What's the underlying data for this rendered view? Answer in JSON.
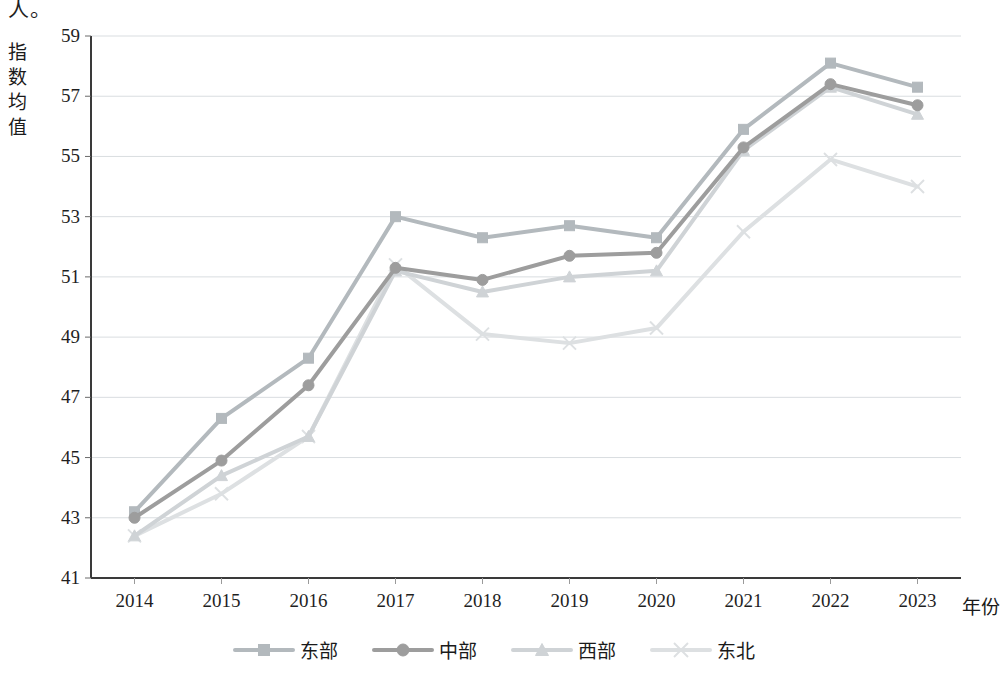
{
  "top_partial_text": "人。",
  "axes": {
    "y_title": "指数均值",
    "y_title_chars": [
      "指",
      "数",
      "均",
      "值"
    ],
    "x_title": "年份",
    "y_ticks": [
      "59",
      "57",
      "55",
      "53",
      "51",
      "49",
      "47",
      "45",
      "43",
      "41"
    ],
    "x_ticks": [
      "2014",
      "2015",
      "2016",
      "2017",
      "2018",
      "2019",
      "2020",
      "2021",
      "2022",
      "2023"
    ]
  },
  "legend": {
    "items": [
      {
        "label": "东部",
        "marker": "square-marker",
        "color": "#b3b9bd"
      },
      {
        "label": "中部",
        "marker": "circle-marker",
        "color": "#9d9d9d"
      },
      {
        "label": "西部",
        "marker": "triangle-marker",
        "color": "#cfd3d6"
      },
      {
        "label": "东北",
        "marker": "x-marker",
        "color": "#dde0e2"
      }
    ]
  },
  "chart_data": {
    "type": "line",
    "title": "",
    "xlabel": "年份",
    "ylabel": "指数均值",
    "categories": [
      "2014",
      "2015",
      "2016",
      "2017",
      "2018",
      "2019",
      "2020",
      "2021",
      "2022",
      "2023"
    ],
    "ylim": [
      41,
      59
    ],
    "ytick_step": 2,
    "grid": "horizontal",
    "legend_position": "bottom",
    "series": [
      {
        "name": "东部",
        "marker": "square",
        "color": "#b3b9bd",
        "values": [
          43.2,
          46.3,
          48.3,
          53.0,
          52.3,
          52.7,
          52.3,
          55.9,
          58.1,
          57.3
        ]
      },
      {
        "name": "中部",
        "marker": "circle",
        "color": "#9d9d9d",
        "values": [
          43.0,
          44.9,
          47.4,
          51.3,
          50.9,
          51.7,
          51.8,
          55.3,
          57.4,
          56.7
        ]
      },
      {
        "name": "西部",
        "marker": "triangle",
        "color": "#cfd3d6",
        "values": [
          42.4,
          44.4,
          45.7,
          51.2,
          50.5,
          51.0,
          51.2,
          55.2,
          57.3,
          56.4
        ]
      },
      {
        "name": "东北",
        "marker": "x",
        "color": "#dde0e2",
        "values": [
          42.4,
          43.8,
          45.7,
          51.4,
          49.1,
          48.8,
          49.3,
          52.5,
          54.9,
          54.0
        ]
      }
    ]
  }
}
